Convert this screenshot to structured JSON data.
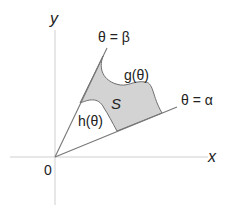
{
  "diagram": {
    "labels": {
      "x_axis": "x",
      "y_axis": "y",
      "origin": "0",
      "ray_beta": "θ = β",
      "ray_alpha": "θ = α",
      "outer_curve": "g(θ)",
      "inner_curve": "h(θ)",
      "region": "S"
    },
    "colors": {
      "region_fill": "#d3d3d3",
      "region_stroke": "#6e6e6e",
      "axis": "#cfcfcf",
      "ray": "#777777",
      "text": "#222222",
      "background": "#ffffff"
    }
  }
}
